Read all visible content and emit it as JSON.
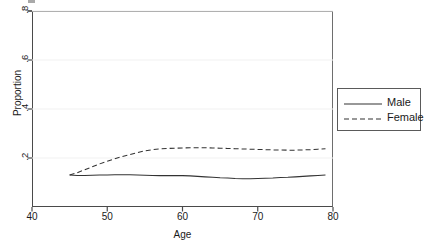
{
  "chart_data": {
    "type": "line",
    "title": "",
    "xlabel": "Age",
    "ylabel": "Proportion",
    "xlim": [
      40,
      80
    ],
    "ylim": [
      0,
      0.8
    ],
    "xticks": [
      40,
      50,
      60,
      70,
      80
    ],
    "xtick_labels": [
      "40",
      "50",
      "60",
      "70",
      "80"
    ],
    "yticks": [
      0.2,
      0.4,
      0.6,
      0.8
    ],
    "ytick_labels": [
      ".2",
      ".4",
      ".6",
      ".8"
    ],
    "grid": "horizontal-faint",
    "legend_position": "right-outside",
    "x": [
      45,
      46,
      47,
      48,
      49,
      50,
      51,
      52,
      53,
      54,
      55,
      56,
      57,
      58,
      59,
      60,
      61,
      62,
      63,
      64,
      65,
      66,
      67,
      68,
      69,
      70,
      71,
      72,
      73,
      74,
      75,
      76,
      77,
      78,
      79
    ],
    "series": [
      {
        "name": "Male",
        "style": "solid",
        "color": "#333333",
        "values": [
          0.131,
          0.129,
          0.129,
          0.13,
          0.131,
          0.131,
          0.132,
          0.132,
          0.132,
          0.131,
          0.13,
          0.129,
          0.128,
          0.128,
          0.128,
          0.128,
          0.127,
          0.125,
          0.123,
          0.121,
          0.119,
          0.118,
          0.116,
          0.115,
          0.115,
          0.116,
          0.117,
          0.118,
          0.12,
          0.121,
          0.123,
          0.125,
          0.127,
          0.129,
          0.131
        ]
      },
      {
        "name": "Female",
        "style": "dashed",
        "color": "#333333",
        "values": [
          0.131,
          0.14,
          0.152,
          0.164,
          0.176,
          0.187,
          0.197,
          0.206,
          0.214,
          0.222,
          0.229,
          0.234,
          0.237,
          0.239,
          0.24,
          0.241,
          0.242,
          0.242,
          0.242,
          0.241,
          0.24,
          0.239,
          0.238,
          0.237,
          0.236,
          0.235,
          0.234,
          0.233,
          0.233,
          0.232,
          0.232,
          0.233,
          0.234,
          0.236,
          0.238
        ]
      }
    ]
  },
  "axes": {
    "y_title": "Proportion",
    "x_title": "Age"
  },
  "legend": {
    "entries": [
      {
        "label": "Male"
      },
      {
        "label": "Female"
      }
    ]
  }
}
